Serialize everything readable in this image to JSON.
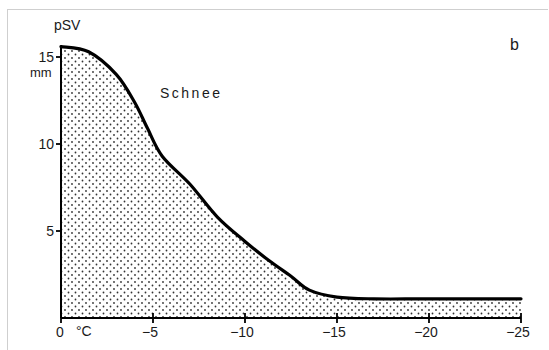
{
  "chart_data": {
    "type": "area",
    "title": "",
    "panel_label": "b",
    "xlabel": "°C",
    "ylabel": "pSV",
    "y_unit": "mm",
    "annotation": "Schnee",
    "x_ticks": [
      0,
      -5,
      -10,
      -15,
      -20,
      -25
    ],
    "x_tick_labels": [
      "0",
      "−5",
      "−10",
      "−15",
      "−20",
      "−25"
    ],
    "y_ticks": [
      5,
      10,
      15
    ],
    "y_tick_labels": [
      "5",
      "10",
      "15"
    ],
    "xlim": [
      0,
      -25
    ],
    "ylim": [
      0,
      16
    ],
    "grid": false,
    "fill": "dotted",
    "series": [
      {
        "name": "Schnee",
        "x": [
          0,
          -1.5,
          -3,
          -4,
          -4.7,
          -5.5,
          -7,
          -8.5,
          -10,
          -11.3,
          -12.5,
          -13.5,
          -15,
          -17,
          -20,
          -25
        ],
        "values": [
          15.6,
          15.3,
          14.0,
          12.4,
          10.9,
          9.3,
          7.7,
          5.8,
          4.4,
          3.3,
          2.4,
          1.6,
          1.2,
          1.1,
          1.1,
          1.1
        ]
      }
    ]
  }
}
